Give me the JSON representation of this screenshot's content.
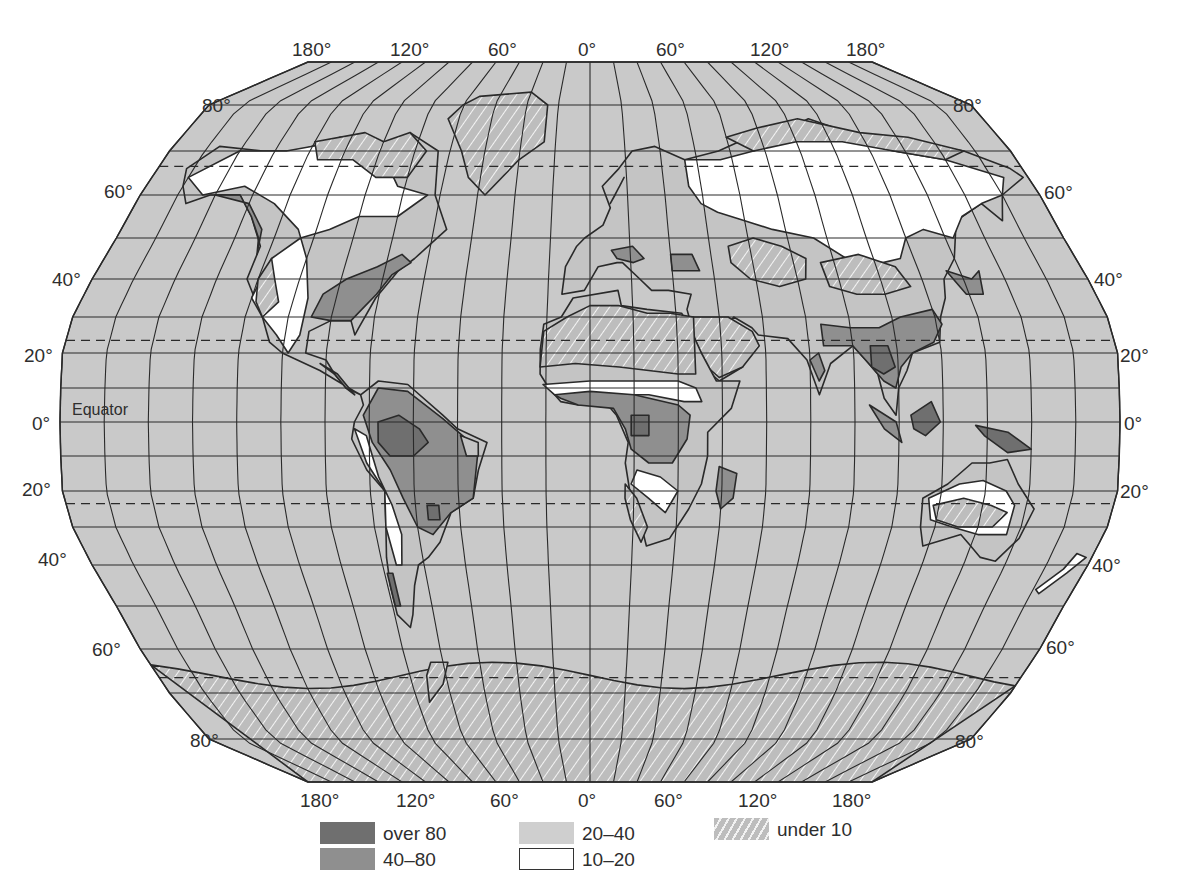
{
  "map": {
    "projection": "Robinson-like world projection",
    "colors": {
      "ocean": "#c9c9c9",
      "grid": "#2a2a2a",
      "over_80": "#6f6f6f",
      "40_80": "#8f8f8f",
      "20_40": "#c4c4c4",
      "10_20": "#ffffff",
      "under_10_base": "#bdbdbd",
      "under_10_hatch": "#f2f2f2",
      "outline": "#2a2a2a"
    },
    "top_longitude_labels": [
      "180°",
      "120°",
      "60°",
      "0°",
      "60°",
      "120°",
      "180°"
    ],
    "bottom_longitude_labels": [
      "180°",
      "120°",
      "60°",
      "0°",
      "60°",
      "120°",
      "180°"
    ],
    "left_latitude_labels": [
      "80°",
      "60°",
      "40°",
      "20°",
      "0°",
      "20°",
      "40°",
      "60°",
      "80°"
    ],
    "right_latitude_labels": [
      "80°",
      "60°",
      "40°",
      "20°",
      "0°",
      "20°",
      "40°",
      "60°",
      "80°"
    ],
    "equator_label": "Equator"
  },
  "legend": {
    "items": [
      {
        "key": "over_80",
        "label": "over 80"
      },
      {
        "key": "40_80",
        "label": "40–80"
      },
      {
        "key": "20_40",
        "label": "20–40"
      },
      {
        "key": "10_20",
        "label": "10–20"
      },
      {
        "key": "under_10",
        "label": "under 10"
      }
    ]
  }
}
